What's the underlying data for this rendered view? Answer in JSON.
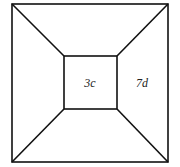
{
  "diagram": {
    "type": "frustum-top-view",
    "colors": {
      "stroke": "#111111",
      "background": "#ffffff",
      "text": "#222222"
    },
    "outer_square": {
      "x1": 12,
      "y1": 4,
      "x2": 168,
      "y2": 162
    },
    "inner_square": {
      "x1": 64,
      "y1": 56,
      "x2": 117,
      "y2": 109
    },
    "labels": [
      {
        "id": "inner",
        "text": "3c",
        "x": 90,
        "y": 86
      },
      {
        "id": "right-face",
        "text": "7d",
        "x": 142,
        "y": 86
      }
    ]
  }
}
